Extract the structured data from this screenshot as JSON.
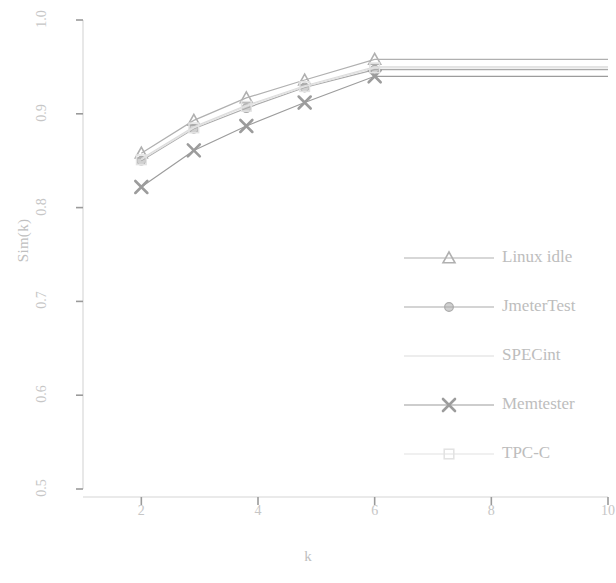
{
  "chart_data": {
    "type": "line",
    "title": "",
    "xlabel": "k",
    "ylabel": "Sim(k)",
    "xlim": [
      1,
      10
    ],
    "ylim": [
      0.5,
      1.0
    ],
    "xticks": [
      "2",
      "4",
      "6",
      "8",
      "10"
    ],
    "xtick_values": [
      2,
      4,
      6,
      8,
      10
    ],
    "yticks": [
      "1.0",
      "0.9",
      "0.8",
      "0.7",
      "0.6",
      "0.5"
    ],
    "ytick_values": [
      1.0,
      0.9,
      0.8,
      0.7,
      0.6,
      0.5
    ],
    "grid": false,
    "legend_position": "right",
    "x": [
      2,
      2.9,
      3.8,
      4.8,
      6,
      10
    ],
    "series": [
      {
        "name": "Linux idle",
        "marker": "triangle",
        "color": "#b0b0b0",
        "values": [
          0.858,
          0.893,
          0.917,
          0.936,
          0.958,
          0.958
        ]
      },
      {
        "name": "JmeterTest",
        "marker": "circle",
        "color": "#aaaaaa",
        "values": [
          0.85,
          0.884,
          0.906,
          0.928,
          0.947,
          0.947
        ]
      },
      {
        "name": "SPECint",
        "marker": "none",
        "color": "#dcdcdc",
        "values": [
          0.852,
          0.886,
          0.909,
          0.93,
          0.95,
          0.95
        ]
      },
      {
        "name": "Memtester",
        "marker": "cross",
        "color": "#9c9c9c",
        "values": [
          0.822,
          0.861,
          0.887,
          0.912,
          0.94,
          0.94
        ]
      },
      {
        "name": "TPC-C",
        "marker": "square",
        "color": "#e2e2e2",
        "values": [
          0.851,
          0.885,
          0.908,
          0.929,
          0.949,
          0.949
        ]
      }
    ]
  },
  "legend": {
    "items": [
      {
        "label": "Linux idle"
      },
      {
        "label": "JmeterTest"
      },
      {
        "label": "SPECint"
      },
      {
        "label": "Memtester"
      },
      {
        "label": "TPC-C"
      }
    ]
  }
}
